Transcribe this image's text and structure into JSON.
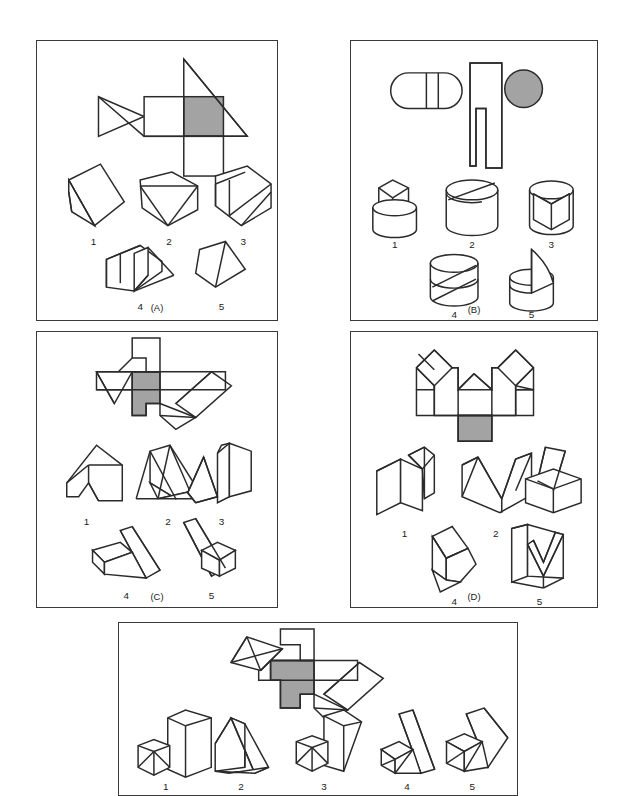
{
  "document": {
    "kind": "spatial-visualization-test-figure",
    "panel_count": 5
  },
  "panels": [
    {
      "id": "A",
      "caption": "(A)",
      "pattern": {
        "description": "unfolded net of a triangular prism: left triangle with interior diagonal, two squares in a row, one shaded square, a square hanging below, and a large right triangle overlapping to the right",
        "shaded_cell": "third square from left",
        "shaded_color": "#a3a3a3"
      },
      "options": [
        {
          "label": "1",
          "description": "oblique wedge / slanted parallelepiped seen from upper-left"
        },
        {
          "label": "2",
          "description": "hexagonal outline with inverted triangular face at front"
        },
        {
          "label": "3",
          "description": "hexagonal block with slanted prism face and two diagonal edges"
        },
        {
          "label": "4",
          "description": "rectangular block with triangular wedge attached on right side"
        },
        {
          "label": "5",
          "description": "small triangular prism seen from the front-left"
        }
      ]
    },
    {
      "id": "B",
      "caption": "(B)",
      "pattern": {
        "description": "net of a cylindrical solid: rounded capsule with two vertical division lines on the left, a tall stepped rectangle in the middle, and a shaded circle on the right",
        "shaded_cell": "right circle",
        "shaded_color": "#a3a3a3"
      },
      "options": [
        {
          "label": "1",
          "description": "cylinder topped by a smaller wedge-cut cylinder with V groove on top"
        },
        {
          "label": "2",
          "description": "cylinder with a single slanted cut across the top face"
        },
        {
          "label": "3",
          "description": "cylinder with a wedge notch cut vertically out of the front"
        },
        {
          "label": "4",
          "description": "cylinder with a thick slanted slab cut through the middle"
        },
        {
          "label": "5",
          "description": "cylinder with a curved sail-like fin rising from a vertical slot"
        }
      ]
    },
    {
      "id": "C",
      "caption": "(C)",
      "pattern": {
        "description": "net with a notched vertical tab on top, a left triangular flap, a shaded central cross cell, and a slanted parallelogram arm to the right ending in a small triangle",
        "shaded_cell": "central cross-shaped cell",
        "shaded_color": "#a3a3a3"
      },
      "options": [
        {
          "label": "1",
          "description": "angular block with a notch cut into the lower front, seen from the left"
        },
        {
          "label": "2",
          "description": "two triangular prisms leaning together forming an A shape"
        },
        {
          "label": "3",
          "description": "triangular wedge with an upright rectangular block on the right"
        },
        {
          "label": "4",
          "description": "long slanted wedge with a smaller wedge attached at lower-left"
        },
        {
          "label": "5",
          "description": "long slanted wedge with a small cube attached at the lower-right"
        }
      ]
    },
    {
      "id": "D",
      "caption": "(D)",
      "pattern": {
        "description": "net with two diamond (rotated square) flaps at upper-left and upper-right, a central V-notched band, side rectangles and a shaded square hanging below the centre",
        "shaded_cell": "square below the centre band",
        "shaded_color": "#a3a3a3"
      },
      "options": [
        {
          "label": "1",
          "description": "rectangular block with a narrow slanted slot cut into the top-right"
        },
        {
          "label": "2",
          "description": "block with a wide V-shaped notch cut from the top"
        },
        {
          "label": "3",
          "description": "low block with an inclined slab rising from the back-left"
        },
        {
          "label": "4",
          "description": "wedge-shaped solid with a slanted top face, seen from the left"
        },
        {
          "label": "5",
          "description": "open box with a slanted V-shaped divider inside"
        }
      ]
    },
    {
      "id": "E",
      "caption": "",
      "pattern": {
        "description": "net with a triangulated diamond flap at upper-left, a notched vertical tab on top, a shaded stepped central cell and a slanted parallelogram arm to the lower-right with a small triangle",
        "shaded_cell": "central stepped cell",
        "shaded_color": "#a3a3a3"
      },
      "options": [
        {
          "label": "1",
          "description": "tall rectangular block with a small triangulated pyramid at lower-left"
        },
        {
          "label": "2",
          "description": "upright slab with a long slanted wedge extending right"
        },
        {
          "label": "3",
          "description": "slanted tall block with a small triangulated pyramid at lower-left"
        },
        {
          "label": "4",
          "description": "slanted wedge with triangulated base, apex at top-right"
        },
        {
          "label": "5",
          "description": "triangulated pyramid at left with a slanted slab leaning to the right"
        }
      ]
    }
  ],
  "style": {
    "line_color": "#2b2b2b",
    "fill_color": "#ffffff",
    "shaded_color": "#a3a3a3",
    "background": "#ffffff"
  }
}
